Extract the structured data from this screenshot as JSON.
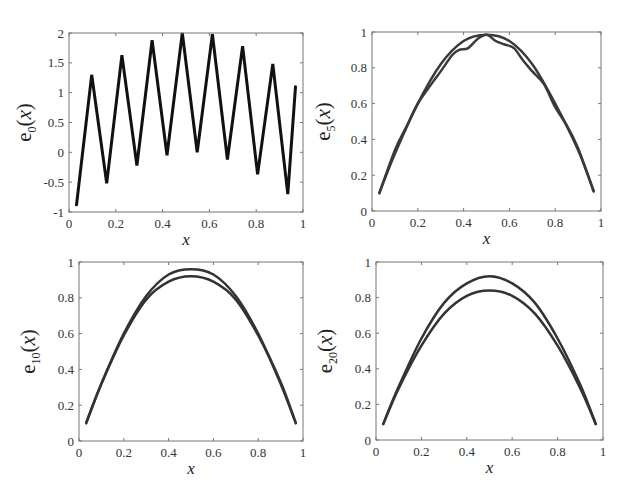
{
  "figure": {
    "width": 629,
    "height": 500,
    "layout": "2x2"
  },
  "chart_data": [
    {
      "id": "e0",
      "type": "line",
      "title": "",
      "xlabel": "x",
      "ylabel": {
        "base": "e",
        "sub": "0",
        "arg": "x"
      },
      "xlim": [
        0,
        1
      ],
      "ylim": [
        -1,
        2
      ],
      "xticks": [
        0,
        0.2,
        0.4,
        0.6,
        0.8,
        1
      ],
      "xtick_labels": [
        "0",
        "0.2",
        "0.4",
        "0.6",
        "0.8",
        "1"
      ],
      "yticks": [
        -1,
        -0.5,
        0,
        0.5,
        1,
        1.5,
        2
      ],
      "ytick_labels": [
        "-1",
        "-0.5",
        "0",
        "0.5",
        "1",
        "1.5",
        "2"
      ],
      "grid": false,
      "frame_px": {
        "left": 69,
        "top": 33,
        "right": 303,
        "bottom": 212
      },
      "series": [
        {
          "name": "e0(x)",
          "color": "#111111",
          "width": 3,
          "x": [
            0.032,
            0.097,
            0.161,
            0.226,
            0.29,
            0.355,
            0.419,
            0.484,
            0.548,
            0.613,
            0.677,
            0.742,
            0.806,
            0.871,
            0.935,
            0.968
          ],
          "y": [
            -0.88,
            1.3,
            -0.52,
            1.63,
            -0.22,
            1.88,
            -0.05,
            2.0,
            0.0,
            1.98,
            -0.12,
            1.78,
            -0.37,
            1.48,
            -0.7,
            1.1
          ]
        }
      ]
    },
    {
      "id": "e5",
      "type": "line",
      "title": "",
      "xlabel": "x",
      "ylabel": {
        "base": "e",
        "sub": "5",
        "arg": "x"
      },
      "xlim": [
        0,
        1
      ],
      "ylim": [
        0,
        1
      ],
      "xticks": [
        0,
        0.2,
        0.4,
        0.6,
        0.8,
        1
      ],
      "xtick_labels": [
        "0",
        "0.2",
        "0.4",
        "0.6",
        "0.8",
        "1"
      ],
      "yticks": [
        0,
        0.2,
        0.4,
        0.6,
        0.8,
        1
      ],
      "ytick_labels": [
        "0",
        "0.2",
        "0.4",
        "0.6",
        "0.8",
        "1"
      ],
      "grid": false,
      "frame_px": {
        "left": 372,
        "top": 32,
        "right": 601,
        "bottom": 211
      },
      "series": [
        {
          "name": "e5(x) smooth",
          "color": "#3a3a3a",
          "width": 2.5,
          "x": [
            0.032,
            0.1,
            0.2,
            0.3,
            0.4,
            0.5,
            0.6,
            0.7,
            0.8,
            0.9,
            0.968
          ],
          "y": [
            0.1,
            0.32,
            0.6,
            0.82,
            0.95,
            0.985,
            0.95,
            0.82,
            0.6,
            0.34,
            0.11
          ]
        },
        {
          "name": "e5(x) wiggly",
          "color": "#3a3a3a",
          "width": 2.5,
          "x": [
            0.032,
            0.1,
            0.15,
            0.2,
            0.26,
            0.3,
            0.35,
            0.38,
            0.42,
            0.46,
            0.5,
            0.54,
            0.58,
            0.62,
            0.66,
            0.7,
            0.75,
            0.8,
            0.85,
            0.9,
            0.968
          ],
          "y": [
            0.1,
            0.34,
            0.47,
            0.6,
            0.71,
            0.78,
            0.87,
            0.9,
            0.91,
            0.96,
            0.985,
            0.95,
            0.93,
            0.91,
            0.84,
            0.78,
            0.71,
            0.58,
            0.48,
            0.35,
            0.11
          ]
        }
      ]
    },
    {
      "id": "e10",
      "type": "line",
      "title": "",
      "xlabel": "x",
      "ylabel": {
        "base": "e",
        "sub": "10",
        "arg": "x"
      },
      "xlim": [
        0,
        1
      ],
      "ylim": [
        0,
        1
      ],
      "xticks": [
        0,
        0.2,
        0.4,
        0.6,
        0.8,
        1
      ],
      "xtick_labels": [
        "0",
        "0.2",
        "0.4",
        "0.6",
        "0.8",
        "1"
      ],
      "yticks": [
        0,
        0.2,
        0.4,
        0.6,
        0.8,
        1
      ],
      "ytick_labels": [
        "0",
        "0.2",
        "0.4",
        "0.6",
        "0.8",
        "1"
      ],
      "grid": false,
      "frame_px": {
        "left": 79,
        "top": 262,
        "right": 303,
        "bottom": 441
      },
      "series": [
        {
          "name": "upper",
          "color": "#333333",
          "width": 2.5,
          "x": [
            0.032,
            0.1,
            0.2,
            0.3,
            0.4,
            0.5,
            0.6,
            0.7,
            0.8,
            0.9,
            0.968
          ],
          "y": [
            0.1,
            0.32,
            0.6,
            0.81,
            0.93,
            0.96,
            0.93,
            0.81,
            0.6,
            0.32,
            0.1
          ]
        },
        {
          "name": "lower",
          "color": "#333333",
          "width": 2.5,
          "x": [
            0.032,
            0.1,
            0.2,
            0.3,
            0.4,
            0.5,
            0.6,
            0.7,
            0.8,
            0.9,
            0.968
          ],
          "y": [
            0.1,
            0.32,
            0.59,
            0.79,
            0.89,
            0.92,
            0.89,
            0.79,
            0.59,
            0.33,
            0.1
          ]
        }
      ]
    },
    {
      "id": "e20",
      "type": "line",
      "title": "",
      "xlabel": "x",
      "ylabel": {
        "base": "e",
        "sub": "20",
        "arg": "x"
      },
      "xlim": [
        0,
        1
      ],
      "ylim": [
        0,
        1
      ],
      "xticks": [
        0,
        0.2,
        0.4,
        0.6,
        0.8,
        1
      ],
      "xtick_labels": [
        "0",
        "0.2",
        "0.4",
        "0.6",
        "0.8",
        "1"
      ],
      "yticks": [
        0,
        0.2,
        0.4,
        0.6,
        0.8,
        1
      ],
      "ytick_labels": [
        "0",
        "0.2",
        "0.4",
        "0.6",
        "0.8",
        "1"
      ],
      "grid": false,
      "frame_px": {
        "left": 376,
        "top": 262,
        "right": 603,
        "bottom": 440
      },
      "series": [
        {
          "name": "upper",
          "color": "#333333",
          "width": 2.5,
          "x": [
            0.032,
            0.1,
            0.2,
            0.3,
            0.4,
            0.5,
            0.6,
            0.7,
            0.8,
            0.9,
            0.968
          ],
          "y": [
            0.09,
            0.3,
            0.57,
            0.77,
            0.88,
            0.92,
            0.88,
            0.77,
            0.57,
            0.31,
            0.09
          ]
        },
        {
          "name": "lower",
          "color": "#333333",
          "width": 2.5,
          "x": [
            0.032,
            0.1,
            0.2,
            0.3,
            0.4,
            0.5,
            0.6,
            0.7,
            0.8,
            0.9,
            0.968
          ],
          "y": [
            0.09,
            0.29,
            0.53,
            0.71,
            0.81,
            0.84,
            0.81,
            0.71,
            0.53,
            0.29,
            0.09
          ]
        }
      ]
    }
  ]
}
